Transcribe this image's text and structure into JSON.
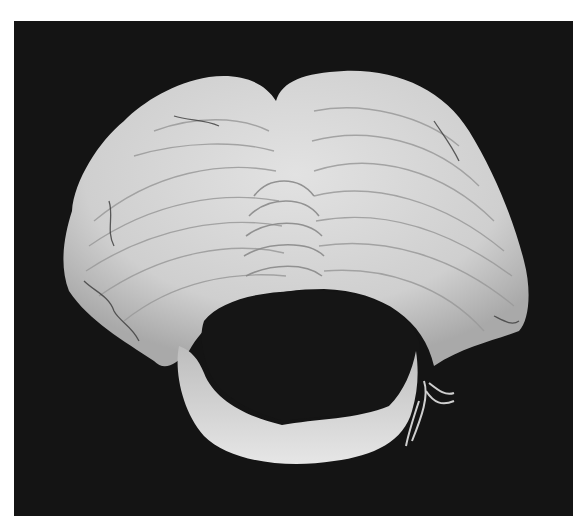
{
  "image": {
    "subject": "cerebellum specimen",
    "description": "Grayscale photograph of a dissected cerebellum showing folia, viewed with a central opening (fourth ventricle region) on a black background",
    "background_color": "#141414",
    "frame_color": "#ffffff",
    "tissue_color": "#d4d4d4",
    "tissue_shadow_color": "#8e8e8e",
    "vessel_color": "#3a3a3a"
  }
}
